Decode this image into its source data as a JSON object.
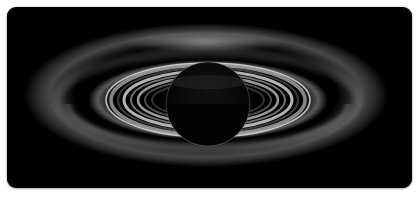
{
  "image": {
    "subject": "Backlit ringed planet (Saturn) silhouette with glowing rings",
    "background_color": "#000000",
    "frame_color": "#ffffff",
    "ring_color": "#e8e8e8",
    "planet_color": "#050505"
  }
}
